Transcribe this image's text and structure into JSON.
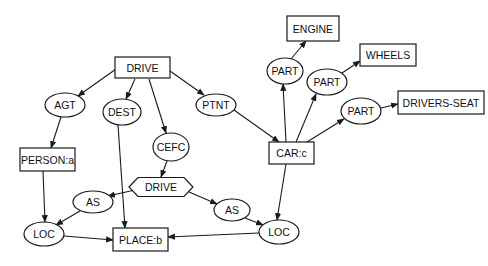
{
  "diagram": {
    "type": "conceptual-graph",
    "colors": {
      "stroke": "#1a1a1a",
      "text": "#111111",
      "background": "#ffffff"
    },
    "nodes": [
      {
        "id": "drive_top",
        "label": "DRIVE",
        "shape": "rect",
        "x": 115,
        "y": 57,
        "w": 55,
        "h": 21
      },
      {
        "id": "agt",
        "label": "AGT",
        "shape": "ellipse",
        "cx": 65,
        "cy": 105,
        "rx": 20,
        "ry": 12
      },
      {
        "id": "dest",
        "label": "DEST",
        "shape": "ellipse",
        "cx": 122,
        "cy": 112,
        "rx": 19,
        "ry": 13
      },
      {
        "id": "ptnt",
        "label": "PTNT",
        "shape": "ellipse",
        "cx": 216,
        "cy": 105,
        "rx": 20,
        "ry": 11
      },
      {
        "id": "cefc",
        "label": "CEFC",
        "shape": "ellipse",
        "cx": 171,
        "cy": 147,
        "rx": 18,
        "ry": 14
      },
      {
        "id": "person",
        "label": "PERSON:a",
        "shape": "rect",
        "x": 20,
        "y": 148,
        "w": 55,
        "h": 23
      },
      {
        "id": "drive_hex",
        "label": "DRIVE",
        "shape": "hexagon",
        "cx": 161,
        "cy": 187,
        "w": 64,
        "h": 19
      },
      {
        "id": "as_left",
        "label": "AS",
        "shape": "ellipse",
        "cx": 93,
        "cy": 202,
        "rx": 20,
        "ry": 11
      },
      {
        "id": "as_right",
        "label": "AS",
        "shape": "ellipse",
        "cx": 232,
        "cy": 210,
        "rx": 18,
        "ry": 11
      },
      {
        "id": "loc_left",
        "label": "LOC",
        "shape": "ellipse",
        "cx": 44,
        "cy": 234,
        "rx": 20,
        "ry": 12
      },
      {
        "id": "place",
        "label": "PLACE:b",
        "shape": "rect",
        "x": 113,
        "y": 228,
        "w": 55,
        "h": 23
      },
      {
        "id": "loc_right",
        "label": "LOC",
        "shape": "ellipse",
        "cx": 279,
        "cy": 232,
        "rx": 20,
        "ry": 12
      },
      {
        "id": "car",
        "label": "CAR:c",
        "shape": "rect",
        "x": 269,
        "y": 142,
        "w": 45,
        "h": 22
      },
      {
        "id": "part_engine",
        "label": "PART",
        "shape": "ellipse",
        "cx": 285,
        "cy": 71,
        "rx": 18,
        "ry": 13
      },
      {
        "id": "engine",
        "label": "ENGINE",
        "shape": "rect",
        "x": 287,
        "y": 16,
        "w": 52,
        "h": 25
      },
      {
        "id": "part_wheels",
        "label": "PART",
        "shape": "ellipse",
        "cx": 327,
        "cy": 82,
        "rx": 20,
        "ry": 13
      },
      {
        "id": "wheels",
        "label": "WHEELS",
        "shape": "rect",
        "x": 360,
        "y": 44,
        "w": 56,
        "h": 22
      },
      {
        "id": "part_seat",
        "label": "PART",
        "shape": "ellipse",
        "cx": 361,
        "cy": 111,
        "rx": 20,
        "ry": 13
      },
      {
        "id": "drivers_seat",
        "label": "DRIVERS-SEAT",
        "shape": "rect",
        "x": 398,
        "y": 91,
        "w": 86,
        "h": 23
      }
    ],
    "edges": [
      {
        "from": "drive_top",
        "to": "agt",
        "x1": 116,
        "y1": 69,
        "x2": 78,
        "y2": 96
      },
      {
        "from": "drive_top",
        "to": "dest",
        "x1": 135,
        "y1": 79,
        "x2": 126,
        "y2": 99
      },
      {
        "from": "drive_top",
        "to": "cefc",
        "x1": 149,
        "y1": 79,
        "x2": 166,
        "y2": 133
      },
      {
        "from": "drive_top",
        "to": "ptnt",
        "x1": 170,
        "y1": 71,
        "x2": 204,
        "y2": 95
      },
      {
        "from": "agt",
        "to": "person",
        "x1": 61,
        "y1": 117,
        "x2": 51,
        "y2": 148
      },
      {
        "from": "dest",
        "to": "place",
        "x1": 118,
        "y1": 125,
        "x2": 125,
        "y2": 228
      },
      {
        "from": "cefc",
        "to": "drive_hex",
        "x1": 167,
        "y1": 161,
        "x2": 161,
        "y2": 177
      },
      {
        "from": "drive_hex",
        "to": "as_left",
        "x1": 135,
        "y1": 190,
        "x2": 108,
        "y2": 196
      },
      {
        "from": "drive_hex",
        "to": "as_right",
        "x1": 189,
        "y1": 192,
        "x2": 217,
        "y2": 204
      },
      {
        "from": "person",
        "to": "loc_left",
        "x1": 43,
        "y1": 171,
        "x2": 45,
        "y2": 222
      },
      {
        "from": "as_left",
        "to": "loc_left",
        "x1": 80,
        "y1": 211,
        "x2": 56,
        "y2": 225
      },
      {
        "from": "loc_left",
        "to": "place",
        "x1": 64,
        "y1": 236,
        "x2": 113,
        "y2": 240
      },
      {
        "from": "as_right",
        "to": "loc_right",
        "x1": 245,
        "y1": 218,
        "x2": 263,
        "y2": 225
      },
      {
        "from": "loc_right",
        "to": "place",
        "x1": 259,
        "y1": 233,
        "x2": 168,
        "y2": 237
      },
      {
        "from": "ptnt",
        "to": "car",
        "x1": 234,
        "y1": 110,
        "x2": 279,
        "y2": 142
      },
      {
        "from": "car",
        "to": "loc_right",
        "x1": 286,
        "y1": 164,
        "x2": 277,
        "y2": 220
      },
      {
        "from": "car",
        "to": "part_engine",
        "x1": 286,
        "y1": 142,
        "x2": 283,
        "y2": 84
      },
      {
        "from": "car",
        "to": "part_wheels",
        "x1": 296,
        "y1": 142,
        "x2": 316,
        "y2": 94
      },
      {
        "from": "car",
        "to": "part_seat",
        "x1": 307,
        "y1": 142,
        "x2": 344,
        "y2": 119
      },
      {
        "from": "part_engine",
        "to": "engine",
        "x1": 291,
        "y1": 59,
        "x2": 306,
        "y2": 41
      },
      {
        "from": "part_wheels",
        "to": "wheels",
        "x1": 342,
        "y1": 73,
        "x2": 360,
        "y2": 61
      },
      {
        "from": "part_seat",
        "to": "drivers_seat",
        "x1": 381,
        "y1": 108,
        "x2": 398,
        "y2": 104
      }
    ]
  }
}
